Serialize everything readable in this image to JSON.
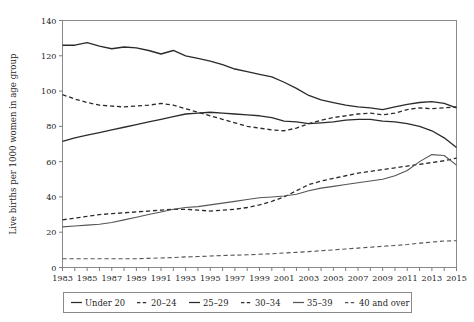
{
  "chart_data": {
    "type": "line",
    "title": "",
    "subtitle": "",
    "xlabel": "",
    "ylabel": "Live births per 1000 women in age group",
    "xlim": [
      1983,
      2015
    ],
    "ylim": [
      0,
      140
    ],
    "yticks": [
      0,
      20,
      40,
      60,
      80,
      100,
      120,
      140
    ],
    "ytick_labels": [
      "0",
      "20",
      "40",
      "60",
      "80",
      "100",
      "120",
      "140"
    ],
    "xticks": [
      1983,
      1984,
      1985,
      1986,
      1987,
      1988,
      1989,
      1990,
      1991,
      1992,
      1993,
      1994,
      1995,
      1996,
      1997,
      1998,
      1999,
      2000,
      2001,
      2002,
      2003,
      2004,
      2005,
      2006,
      2007,
      2008,
      2009,
      2010,
      2011,
      2012,
      2013,
      2014,
      2015
    ],
    "xtick_labels": [
      "1983",
      "1985",
      "1987",
      "1989",
      "1991",
      "1993",
      "1995",
      "1997",
      "1999",
      "2001",
      "2003",
      "2005",
      "2007",
      "2009",
      "2011",
      "2013",
      "2015"
    ],
    "xtick_label_years": [
      1983,
      1985,
      1987,
      1989,
      1991,
      1993,
      1995,
      1997,
      1999,
      2001,
      2003,
      2005,
      2007,
      2009,
      2011,
      2013,
      2015
    ],
    "grid": false,
    "legend_position": "bottom",
    "x": [
      1983,
      1984,
      1985,
      1986,
      1987,
      1988,
      1989,
      1990,
      1991,
      1992,
      1993,
      1994,
      1995,
      1996,
      1997,
      1998,
      1999,
      2000,
      2001,
      2002,
      2003,
      2004,
      2005,
      2006,
      2007,
      2008,
      2009,
      2010,
      2011,
      2012,
      2013,
      2014,
      2015
    ],
    "series": [
      {
        "name": "Under 20",
        "style": "solid",
        "color": "#2b2b2b",
        "width": 1.35,
        "values": [
          126,
          126,
          127.5,
          125.5,
          124,
          125,
          124.5,
          123,
          121,
          123,
          120,
          118.5,
          117,
          115,
          112.5,
          111,
          109.5,
          108,
          105,
          101.5,
          97.5,
          95,
          93.5,
          92,
          91,
          90.5,
          89.5,
          91,
          92.5,
          93.5,
          94,
          93,
          90.5
        ]
      },
      {
        "name": "20–24",
        "style": "dashed",
        "color": "#2b2b2b",
        "width": 1.3,
        "values": [
          98,
          95.5,
          93.5,
          92,
          91.5,
          91,
          91.5,
          92,
          93,
          92,
          90,
          88,
          86,
          84,
          82,
          80,
          79,
          78,
          77.5,
          79,
          81.5,
          83.5,
          85,
          86,
          87,
          87.5,
          86.5,
          87.5,
          89.5,
          90.5,
          90,
          90.5,
          91
        ]
      },
      {
        "name": "25–29",
        "style": "solid",
        "color": "#2b2b2b",
        "width": 1.3,
        "values": [
          71.5,
          73.5,
          75,
          76.5,
          78,
          79.5,
          81,
          82.5,
          84,
          85.5,
          87,
          87.5,
          88,
          87.5,
          87,
          86.5,
          86,
          85,
          83,
          82.5,
          81.5,
          82,
          82.5,
          83.5,
          84,
          84,
          83,
          82.5,
          81.5,
          80,
          77.5,
          73.5,
          68
        ]
      },
      {
        "name": "30–34",
        "style": "dashed",
        "color": "#2b2b2b",
        "width": 1.3,
        "values": [
          27,
          28,
          29,
          30,
          30.5,
          31,
          31.5,
          32,
          32.5,
          33,
          33,
          32.5,
          32,
          32.5,
          33,
          34,
          35.5,
          37.5,
          40,
          43.5,
          47,
          49,
          50.5,
          52,
          53.5,
          54.5,
          55.5,
          56.5,
          57.5,
          58.5,
          59.5,
          60.5,
          62
        ]
      },
      {
        "name": "35–39",
        "style": "solid",
        "color": "#555555",
        "width": 1.1,
        "values": [
          23,
          23.5,
          24,
          24.5,
          25.5,
          27,
          28.5,
          30,
          31.5,
          33,
          34,
          34.5,
          35.5,
          36.5,
          37.5,
          38.5,
          39.5,
          40,
          40.5,
          41.5,
          43.5,
          45,
          46,
          47,
          48,
          49,
          50,
          52,
          55,
          60,
          64,
          63.5,
          58
        ]
      },
      {
        "name": "40 and over",
        "style": "dashed",
        "color": "#555555",
        "width": 1.1,
        "values": [
          5,
          5,
          5,
          5,
          5,
          5,
          5,
          5.2,
          5.4,
          5.6,
          6,
          6.2,
          6.5,
          6.8,
          7,
          7.2,
          7.5,
          7.8,
          8.2,
          8.6,
          9,
          9.5,
          10,
          10.5,
          11,
          11.5,
          12,
          12.5,
          13,
          13.8,
          14.4,
          15,
          15.2
        ]
      }
    ]
  },
  "legend": {
    "entries": [
      {
        "label": "Under 20",
        "style": "solid",
        "color": "#2b2b2b"
      },
      {
        "label": "20–24",
        "style": "dashed",
        "color": "#2b2b2b"
      },
      {
        "label": "25–29",
        "style": "solid",
        "color": "#2b2b2b"
      },
      {
        "label": "30–34",
        "style": "dashed",
        "color": "#2b2b2b"
      },
      {
        "label": "35–39",
        "style": "solid",
        "color": "#555555"
      },
      {
        "label": "40 and over",
        "style": "dashed",
        "color": "#555555"
      }
    ]
  }
}
